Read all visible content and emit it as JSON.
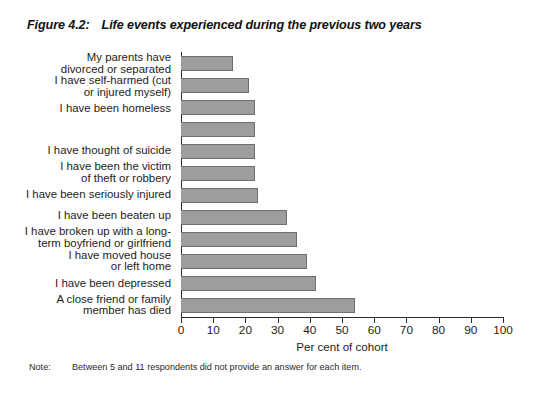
{
  "figure": {
    "number": "Figure 4.2:",
    "title": "Life events experienced during the previous two years"
  },
  "note": {
    "label": "Note:",
    "text": "Between 5 and 11 respondents did not provide an answer for each item."
  },
  "axis": {
    "x_title": "Per cent of cohort",
    "ticks": [
      "0",
      "10",
      "20",
      "30",
      "40",
      "50",
      "60",
      "70",
      "80",
      "90",
      "100"
    ]
  },
  "style": {
    "bar_fill": "#9d9d9d",
    "bar_border": "#6f6f6f",
    "axis_color": "#2b2b2b",
    "background": "#ffffff"
  },
  "chart_data": {
    "type": "bar",
    "orientation": "horizontal",
    "title": "Life events experienced during the previous two years",
    "xlabel": "Per cent of cohort",
    "ylabel": "",
    "xlim": [
      0,
      100
    ],
    "xticks": [
      0,
      10,
      20,
      30,
      40,
      50,
      60,
      70,
      80,
      90,
      100
    ],
    "grid": false,
    "legend": "none",
    "categories": [
      "My parents have divorced or separated",
      "I have self-harmed (cut or injured myself)",
      "I have been homeless",
      "I have thought of suicide",
      "I have been the victim of theft or robbery",
      "I have been seriously injured",
      "I have been beaten up",
      "I have broken up with a long-term boyfriend or girlfriend",
      "I have moved house or left home",
      "I have been depressed",
      "A close friend or family member has died"
    ],
    "category_lines": [
      [
        "My parents have",
        "divorced or separated"
      ],
      [
        "I have self-harmed (cut",
        "or injured myself)"
      ],
      [
        "I have been homeless"
      ],
      [
        ""
      ],
      [
        "I have thought of suicide"
      ],
      [
        "I have been the victim",
        "of theft or robbery"
      ],
      [
        "I have been seriously injured"
      ],
      [
        "I have been beaten up"
      ],
      [
        "I have broken up with a long-",
        "term boyfriend or girlfriend"
      ],
      [
        "I have moved house",
        "or left home"
      ],
      [
        "I have been depressed"
      ],
      [
        "A close friend or family",
        "member has died"
      ]
    ],
    "values": [
      16,
      21,
      23,
      23,
      23,
      23,
      33,
      36,
      39,
      42,
      54
    ],
    "bars": [
      {
        "label": "My parents have divorced or separated",
        "value": 16
      },
      {
        "label": "I have self-harmed (cut or injured myself)",
        "value": 21
      },
      {
        "label": "I have been homeless",
        "value": 23
      },
      {
        "label": "(unlabelled item)",
        "value": 23
      },
      {
        "label": "I have thought of suicide",
        "value": 23
      },
      {
        "label": "I have been the victim of theft or robbery",
        "value": 23
      },
      {
        "label": "I have been seriously injured",
        "value": 24
      },
      {
        "label": "I have been beaten up",
        "value": 33
      },
      {
        "label": "I have broken up with a long-term boyfriend or girlfriend",
        "value": 36
      },
      {
        "label": "I have moved house or left home",
        "value": 39
      },
      {
        "label": "I have been depressed",
        "value": 42
      },
      {
        "label": "A close friend or family member has died",
        "value": 54
      }
    ]
  }
}
